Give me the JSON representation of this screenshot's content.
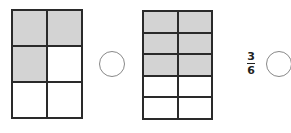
{
  "figures": [
    {
      "id": "grid-a",
      "rows": 3,
      "cols": 2,
      "shaded_cells": [
        0,
        1,
        2
      ],
      "fraction_shaded": "3/6",
      "box": {
        "left": 11,
        "top": 9,
        "width": 72,
        "height": 110
      }
    },
    {
      "id": "grid-b",
      "rows": 5,
      "cols": 2,
      "shaded_cells": [
        0,
        1,
        2,
        3,
        4,
        5
      ],
      "fraction_shaded": "6/10",
      "box": {
        "left": 142,
        "top": 10,
        "width": 71,
        "height": 110
      }
    }
  ],
  "comparison_circles": [
    {
      "id": "circle-1",
      "value": "",
      "center": [
        112,
        64
      ],
      "radius": 13
    },
    {
      "id": "circle-2",
      "value": "",
      "center": [
        279,
        64
      ],
      "radius": 13
    }
  ],
  "fraction_label": {
    "numerator": "3",
    "denominator": "6"
  },
  "colors": {
    "shade": "#d3d3d3",
    "line": "#2a2a2a",
    "circle": "#888888"
  }
}
